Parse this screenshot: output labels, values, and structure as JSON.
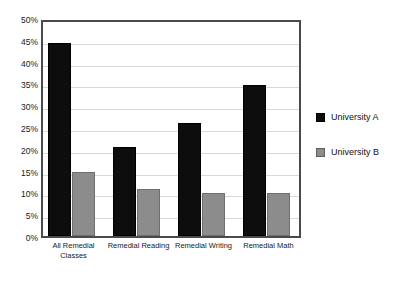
{
  "chart_data": {
    "type": "bar",
    "title": "",
    "subtitle": "",
    "xlabel": "",
    "ylabel": "",
    "categories": [
      "All Remedial Classes",
      "Remedial Reading",
      "Remedial Writing",
      "Remedial Math"
    ],
    "series": [
      {
        "name": "University A",
        "color": "#0d0d0d",
        "values": [
          44.2,
          20.5,
          26.0,
          34.7
        ]
      },
      {
        "name": "University B",
        "color": "#8c8c8c",
        "values": [
          14.6,
          10.8,
          9.8,
          9.8
        ]
      }
    ],
    "ylim": [
      0,
      50
    ],
    "ytick_values": [
      0,
      5,
      10,
      15,
      20,
      25,
      30,
      35,
      40,
      45,
      50
    ],
    "ytick_labels": [
      "0%",
      "5%",
      "10%",
      "15%",
      "20%",
      "25%",
      "30%",
      "35%",
      "40%",
      "45%",
      "50%"
    ],
    "grid": true,
    "grid_axis": "y",
    "legend_position": "right",
    "value_format": "percent"
  },
  "legend": {
    "entries": [
      {
        "label": "University A"
      },
      {
        "label": "University B"
      }
    ]
  },
  "colors": {
    "series_a": "#0d0d0d",
    "series_b": "#8c8c8c",
    "gridline": "#d8d8d8",
    "axis_border": "#4a4a4a",
    "background": "#ffffff",
    "text": "#1a1a1a"
  }
}
